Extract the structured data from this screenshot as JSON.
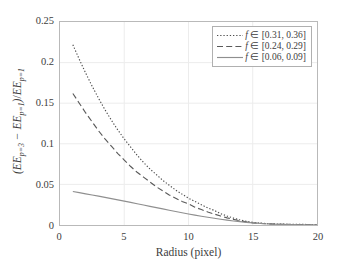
{
  "chart_data": {
    "type": "line",
    "title": "",
    "xlabel": "Radius (pixel)",
    "ylabel": "(EE_{p=3} - EE_{p=1}) / EE_{p=1}",
    "xlim": [
      0,
      20
    ],
    "ylim": [
      0,
      0.25
    ],
    "xticks": [
      0,
      5,
      10,
      15,
      20
    ],
    "yticks": [
      0,
      0.05,
      0.1,
      0.15,
      0.2,
      0.25
    ],
    "xtick_labels": [
      "0",
      "5",
      "10",
      "15",
      "20"
    ],
    "ytick_labels": [
      "0",
      "0.05",
      "0.1",
      "0.15",
      "0.2",
      "0.25"
    ],
    "grid": true,
    "legend_position": "top-right",
    "x": [
      1,
      1.5,
      2,
      2.5,
      3,
      3.5,
      4,
      4.5,
      5,
      5.5,
      6,
      6.5,
      7,
      7.5,
      8,
      8.5,
      9,
      9.5,
      10,
      10.5,
      11,
      11.5,
      12,
      12.5,
      13,
      13.5,
      14,
      14.5,
      15,
      16,
      17,
      18,
      19,
      20
    ],
    "series": [
      {
        "name": "f ∈ [0.31, 0.36]",
        "linestyle": "dotted",
        "color": "#4d4d4d",
        "values": [
          0.222,
          0.204,
          0.187,
          0.171,
          0.156,
          0.142,
          0.129,
          0.117,
          0.106,
          0.096,
          0.086,
          0.077,
          0.069,
          0.062,
          0.055,
          0.049,
          0.043,
          0.038,
          0.033,
          0.029,
          0.025,
          0.021,
          0.018,
          0.014,
          0.011,
          0.0085,
          0.0062,
          0.0045,
          0.0032,
          0.0018,
          0.0012,
          0.0009,
          0.0007,
          0.0006
        ]
      },
      {
        "name": "f ∈ [0.24, 0.29]",
        "linestyle": "dashed",
        "color": "#5a5a5a",
        "values": [
          0.162,
          0.15,
          0.138,
          0.127,
          0.116,
          0.106,
          0.097,
          0.088,
          0.08,
          0.072,
          0.065,
          0.059,
          0.053,
          0.047,
          0.042,
          0.037,
          0.033,
          0.029,
          0.026,
          0.022,
          0.019,
          0.016,
          0.0135,
          0.011,
          0.0088,
          0.0069,
          0.0052,
          0.0038,
          0.0027,
          0.0015,
          0.0009,
          0.0006,
          0.0004,
          0.0003
        ]
      },
      {
        "name": "f ∈ [0.06, 0.09]",
        "linestyle": "solid",
        "color": "#8f8f8f",
        "values": [
          0.0412,
          0.0398,
          0.0384,
          0.037,
          0.0355,
          0.034,
          0.0325,
          0.031,
          0.0294,
          0.0278,
          0.0262,
          0.0246,
          0.023,
          0.0214,
          0.0198,
          0.0182,
          0.0166,
          0.0151,
          0.0136,
          0.0122,
          0.0108,
          0.0095,
          0.0083,
          0.0071,
          0.006,
          0.005,
          0.0041,
          0.0033,
          0.0026,
          0.0015,
          0.0008,
          0.0004,
          0.0002,
          0.0001
        ]
      }
    ]
  },
  "axis": {
    "frame_color": "#b9b9b9",
    "grid_color": "#ececec"
  }
}
